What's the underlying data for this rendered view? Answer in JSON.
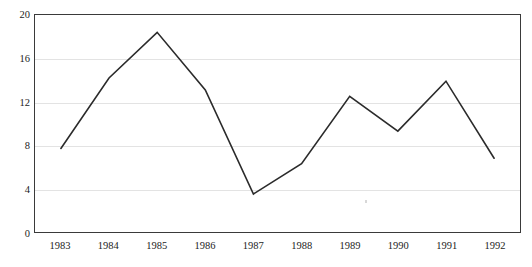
{
  "chart_data": {
    "type": "line",
    "title": "",
    "subtitle": "",
    "xlabel": "",
    "ylabel": "",
    "categories": [
      "1983",
      "1984",
      "1985",
      "1986",
      "1987",
      "1988",
      "1989",
      "1990",
      "1991",
      "1992"
    ],
    "values": [
      7.7,
      14.2,
      18.4,
      13.1,
      3.5,
      6.3,
      12.5,
      9.3,
      13.9,
      6.8
    ],
    "series": [
      {
        "name": "",
        "values": [
          7.7,
          14.2,
          18.4,
          13.1,
          3.5,
          6.3,
          12.5,
          9.3,
          13.9,
          6.8
        ]
      }
    ],
    "ylim": [
      0,
      20
    ],
    "y_ticks": [
      0,
      4,
      8,
      12,
      16,
      20
    ],
    "y_tick_labels": [
      "0",
      "4",
      "8",
      "12",
      "16",
      "20"
    ],
    "x_tick_labels": [
      "1983",
      "1984",
      "1985",
      "1986",
      "1987",
      "1988",
      "1989",
      "1990",
      "1991",
      "1992"
    ],
    "grid": true,
    "grid_axis": "y",
    "legend": false,
    "legend_position": "none",
    "line_color": "#2b2b2b",
    "line_width": 1.6,
    "markers": false,
    "frame_color": "#3a3a3a",
    "grid_color": "#e3e3e3",
    "background": "#ffffff"
  },
  "axes": {
    "y": {
      "ticks": [
        {
          "label": "20",
          "value": 20
        },
        {
          "label": "16",
          "value": 16
        },
        {
          "label": "12",
          "value": 12
        },
        {
          "label": "8",
          "value": 8
        },
        {
          "label": "4",
          "value": 4
        },
        {
          "label": "0",
          "value": 0
        }
      ]
    },
    "x": {
      "ticks": [
        {
          "label": "1983"
        },
        {
          "label": "1984"
        },
        {
          "label": "1985"
        },
        {
          "label": "1986"
        },
        {
          "label": "1987"
        },
        {
          "label": "1988"
        },
        {
          "label": "1989"
        },
        {
          "label": "1990"
        },
        {
          "label": "1991"
        },
        {
          "label": "1992"
        }
      ]
    }
  }
}
